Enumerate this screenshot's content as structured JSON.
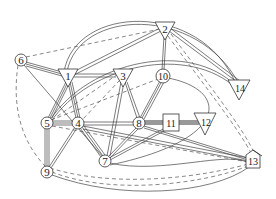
{
  "diagram": {
    "type": "network-graph",
    "nodes": [
      {
        "id": "1",
        "label": "1",
        "shape": "triangle-down",
        "x": 68,
        "y": 76
      },
      {
        "id": "2",
        "label": "2",
        "shape": "triangle-down",
        "x": 165,
        "y": 31
      },
      {
        "id": "3",
        "label": "3",
        "shape": "triangle-down",
        "x": 123,
        "y": 76
      },
      {
        "id": "4",
        "label": "4",
        "shape": "circle",
        "x": 78,
        "y": 123
      },
      {
        "id": "5",
        "label": "5",
        "shape": "circle",
        "x": 47,
        "y": 123
      },
      {
        "id": "6",
        "label": "6",
        "shape": "circle",
        "x": 21,
        "y": 60
      },
      {
        "id": "7",
        "label": "7",
        "shape": "circle",
        "x": 105,
        "y": 161
      },
      {
        "id": "8",
        "label": "8",
        "shape": "circle",
        "x": 139,
        "y": 123
      },
      {
        "id": "9",
        "label": "9",
        "shape": "circle",
        "x": 47,
        "y": 172
      },
      {
        "id": "10",
        "label": "10",
        "shape": "circle",
        "x": 163,
        "y": 76
      },
      {
        "id": "11",
        "label": "11",
        "shape": "square",
        "x": 171,
        "y": 123
      },
      {
        "id": "12",
        "label": "12",
        "shape": "triangle-down",
        "x": 205,
        "y": 123
      },
      {
        "id": "13",
        "label": "13",
        "shape": "house",
        "x": 253,
        "y": 161
      },
      {
        "id": "14",
        "label": "14",
        "shape": "triangle-down",
        "x": 239,
        "y": 87
      }
    ],
    "edges": [
      {
        "from": "6",
        "to": "1",
        "style": "triple"
      },
      {
        "from": "6",
        "to": "2",
        "style": "dashed"
      },
      {
        "from": "6",
        "to": "9",
        "style": "dashed"
      },
      {
        "from": "6",
        "to": "7",
        "style": "single"
      },
      {
        "from": "1",
        "to": "2",
        "style": "double"
      },
      {
        "from": "1",
        "to": "3",
        "style": "double"
      },
      {
        "from": "1",
        "to": "4",
        "style": "triple"
      },
      {
        "from": "1",
        "to": "5",
        "style": "triple"
      },
      {
        "from": "1",
        "to": "14",
        "style": "double-arc"
      },
      {
        "from": "2",
        "to": "10",
        "style": "double"
      },
      {
        "from": "2",
        "to": "14",
        "style": "double"
      },
      {
        "from": "2",
        "to": "13",
        "style": "dashed"
      },
      {
        "from": "2",
        "to": "5",
        "style": "dashed"
      },
      {
        "from": "3",
        "to": "8",
        "style": "double"
      },
      {
        "from": "3",
        "to": "7",
        "style": "double"
      },
      {
        "from": "3",
        "to": "4",
        "style": "dashed"
      },
      {
        "from": "4",
        "to": "5",
        "style": "triple"
      },
      {
        "from": "4",
        "to": "7",
        "style": "triple"
      },
      {
        "from": "4",
        "to": "8",
        "style": "double"
      },
      {
        "from": "4",
        "to": "9",
        "style": "double"
      },
      {
        "from": "4",
        "to": "13",
        "style": "double"
      },
      {
        "from": "5",
        "to": "9",
        "style": "triple"
      },
      {
        "from": "5",
        "to": "10",
        "style": "dashed"
      },
      {
        "from": "7",
        "to": "8",
        "style": "double"
      },
      {
        "from": "7",
        "to": "11",
        "style": "double"
      },
      {
        "from": "7",
        "to": "13",
        "style": "single-arc"
      },
      {
        "from": "8",
        "to": "10",
        "style": "triple"
      },
      {
        "from": "8",
        "to": "11",
        "style": "thick"
      },
      {
        "from": "8",
        "to": "13",
        "style": "double"
      },
      {
        "from": "11",
        "to": "12",
        "style": "thick"
      },
      {
        "from": "9",
        "to": "13",
        "style": "dashed-arc"
      },
      {
        "from": "1",
        "to": "14",
        "style": "double-arc-outer"
      }
    ]
  }
}
